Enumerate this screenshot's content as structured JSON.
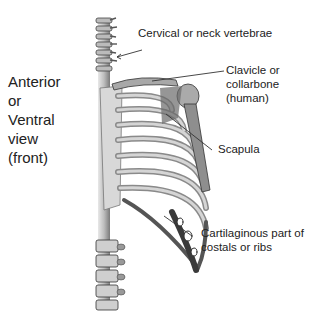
{
  "view_label": [
    "Anterior",
    "or",
    "Ventral",
    "view",
    "(front)"
  ],
  "labels": {
    "cervical": "Cervical or neck vertebrae",
    "clavicle": [
      "Clavicle or",
      "collarbone",
      "(human)"
    ],
    "scapula": "Scapula",
    "cartilage": [
      "Cartilaginous part of",
      "costals or ribs"
    ]
  },
  "colors": {
    "bone_light": "#d9d9d9",
    "bone_mid": "#9a9a9a",
    "bone_dark": "#3a3a3a",
    "leader_line": "#333333",
    "text": "#222222"
  }
}
